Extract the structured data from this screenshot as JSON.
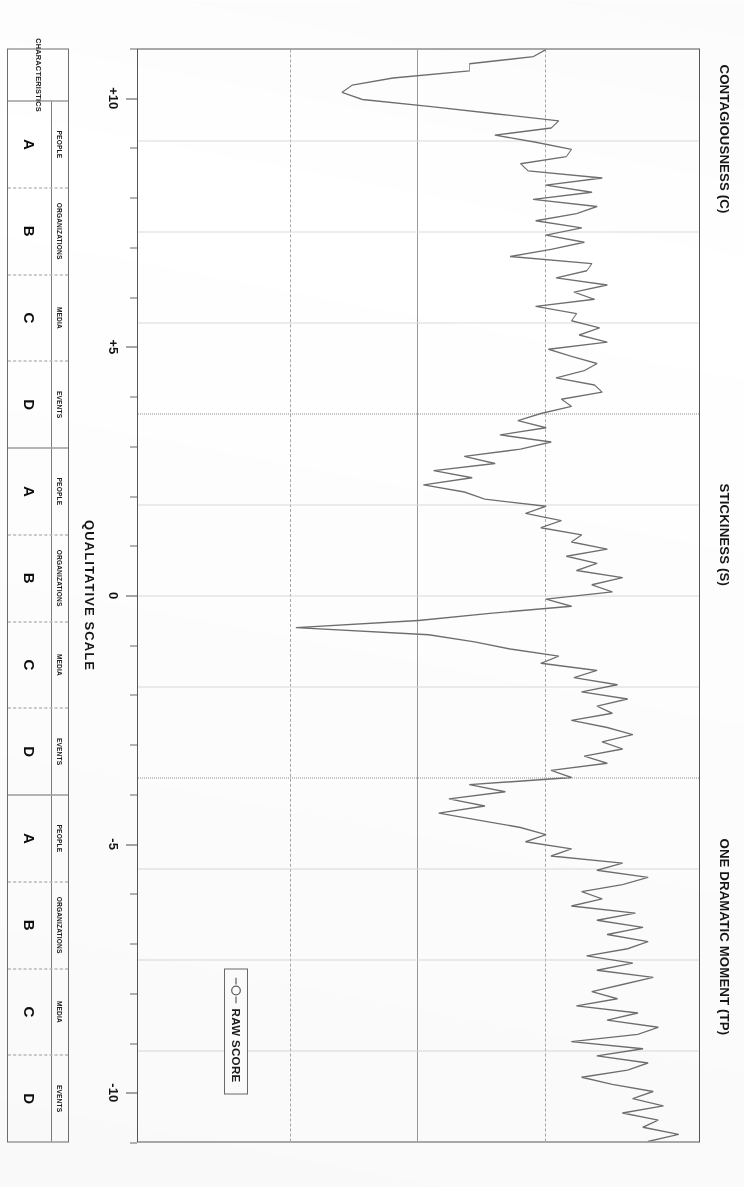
{
  "sections": [
    {
      "title": "CONTAGIOUSNESS (C)"
    },
    {
      "title": "STICKINESS (S)"
    },
    {
      "title": "ONE DRAMATIC MOMENT (TP)"
    }
  ],
  "legend": {
    "label": "RAW SCORE",
    "marker": "line-circle-marker",
    "series_color": "#6e6e6e"
  },
  "axis": {
    "title": "QUALITATIVE SCALE",
    "labels": [
      "+10",
      "+5",
      "0",
      "-5",
      "-10"
    ],
    "label_values": [
      10,
      5,
      0,
      -5,
      -10
    ],
    "min": -11,
    "max": 11,
    "tick_step": 1
  },
  "gridlines": [
    {
      "value": 5,
      "style": "dashed"
    },
    {
      "value": 0,
      "style": "solid"
    },
    {
      "value": -5,
      "style": "dashed"
    }
  ],
  "table": {
    "row_header": "CHARACTERISTICS",
    "columns": [
      {
        "sub": "PEOPLE",
        "letter": "A"
      },
      {
        "sub": "ORGANIZATIONS",
        "letter": "B"
      },
      {
        "sub": "MEDIA",
        "letter": "C"
      },
      {
        "sub": "EVENTS",
        "letter": "D"
      },
      {
        "sub": "PEOPLE",
        "letter": "A"
      },
      {
        "sub": "ORGANIZATIONS",
        "letter": "B"
      },
      {
        "sub": "MEDIA",
        "letter": "C"
      },
      {
        "sub": "EVENTS",
        "letter": "D"
      },
      {
        "sub": "PEOPLE",
        "letter": "A"
      },
      {
        "sub": "ORGANIZATIONS",
        "letter": "B"
      },
      {
        "sub": "MEDIA",
        "letter": "C"
      },
      {
        "sub": "EVENTS",
        "letter": "D"
      }
    ]
  },
  "chart_data": {
    "type": "line",
    "title": "",
    "xlabel": "CHARACTERISTICS",
    "ylabel": "QUALITATIVE SCALE",
    "ylim": [
      -11,
      11
    ],
    "grid": true,
    "legend_position": "bottom-right",
    "series": [
      {
        "name": "RAW SCORE",
        "color": "#6e6e6e",
        "values": [
          5.0,
          4.5,
          2.0,
          2.0,
          -1.0,
          -2.6,
          -3.0,
          -2.2,
          0.5,
          3.0,
          5.5,
          5.2,
          3.0,
          4.6,
          6.0,
          5.8,
          4.0,
          4.3,
          7.2,
          5.0,
          6.8,
          4.5,
          7.0,
          6.2,
          4.6,
          6.4,
          5.0,
          6.5,
          5.2,
          3.6,
          6.8,
          6.6,
          5.4,
          7.4,
          6.1,
          6.9,
          4.6,
          6.2,
          6.0,
          7.1,
          6.3,
          7.4,
          5.1,
          6.0,
          7.0,
          6.5,
          5.4,
          6.9,
          7.2,
          5.6,
          6.0,
          4.8,
          3.9,
          5.0,
          3.2,
          5.2,
          4.0,
          1.8,
          3.0,
          0.6,
          2.1,
          0.2,
          1.8,
          2.6,
          5.0,
          4.2,
          5.6,
          4.8,
          6.4,
          6.0,
          7.4,
          5.8,
          7.0,
          6.2,
          8.0,
          6.8,
          7.6,
          5.0,
          6.0,
          2.8,
          0.0,
          -4.8,
          0.4,
          2.2,
          3.6,
          5.5,
          4.8,
          7.0,
          6.1,
          7.8,
          6.4,
          8.2,
          7.0,
          7.6,
          6.0,
          7.4,
          8.4,
          7.2,
          8.0,
          6.5,
          7.4,
          5.2,
          6.0,
          2.0,
          3.4,
          1.2,
          2.6,
          0.8,
          2.4,
          4.0,
          5.0,
          4.2,
          6.0,
          5.2,
          8.0,
          7.0,
          9.0,
          8.0,
          6.4,
          7.2,
          6.0,
          8.5,
          7.0,
          8.8,
          7.4,
          9.0,
          8.2,
          6.6,
          8.4,
          7.0,
          9.2,
          8.0,
          6.8,
          7.8,
          6.2,
          8.6,
          7.4,
          9.4,
          8.6,
          6.0,
          8.8,
          7.0,
          9.0,
          8.2,
          6.4,
          7.6,
          9.2,
          8.4,
          9.6,
          8.0,
          9.4,
          8.8,
          10.2,
          9.0
        ]
      }
    ]
  }
}
